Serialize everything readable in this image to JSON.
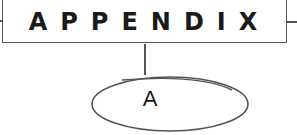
{
  "heading": {
    "title": "APPENDIX"
  },
  "node": {
    "label": "A"
  },
  "colors": {
    "stroke": "#555555",
    "text": "#1a1a1a",
    "background": "#ffffff"
  }
}
